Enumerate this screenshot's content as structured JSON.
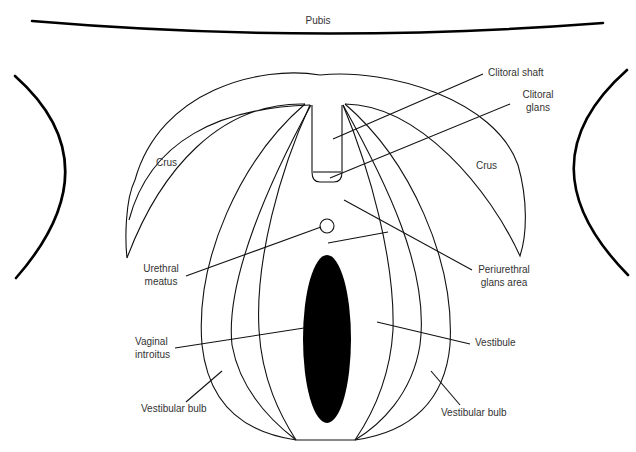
{
  "diagram": {
    "colors": {
      "line": "#111111",
      "text": "#333333",
      "introitus_fill": "#000000",
      "background": "#ffffff"
    },
    "labels": {
      "pubis": "Pubis",
      "clitoral_shaft": "Clitoral shaft",
      "clitoral_glans": "Clitoral\nglans",
      "crus_left": "Crus",
      "crus_right": "Crus",
      "urethral_meatus": "Urethral\nmeatus",
      "periurethral_glans_area": "Periurethral\nglans area",
      "vaginal_introitus": "Vaginal\nintroitus",
      "vestibule": "Vestibule",
      "vestibular_bulb_left": "Vestibular bulb",
      "vestibular_bulb_right": "Vestibular bulb"
    },
    "structures": [
      "pubis-arc",
      "left-thigh-curve",
      "right-thigh-curve",
      "left-crus",
      "right-crus",
      "clitoral-shaft",
      "clitoral-glans",
      "urethral-meatus",
      "vestibule",
      "vaginal-introitus",
      "left-vestibular-bulb",
      "right-vestibular-bulb"
    ]
  }
}
